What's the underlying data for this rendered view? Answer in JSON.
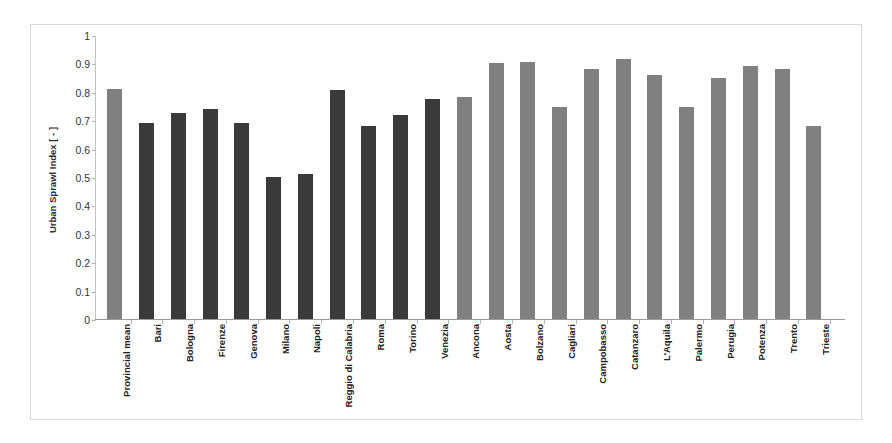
{
  "chart_data": {
    "type": "bar",
    "title": "",
    "subtitle": "",
    "xlabel": "",
    "ylabel": "Urban Sprawl Index [ - ]",
    "ylim": [
      0,
      1
    ],
    "yticks": [
      "0",
      "0.1",
      "0.2",
      "0.3",
      "0.4",
      "0.5",
      "0.6",
      "0.7",
      "0.8",
      "0.9",
      "1"
    ],
    "grid": false,
    "legend": "none",
    "colors": {
      "mean_and_provincial_capitals": "#808080",
      "metropolitan_cities": "#3a3a3a",
      "axis": "#9b9b9b",
      "frame": "#d9d9d9",
      "text": "#222222"
    },
    "categories": [
      "Provincial mean",
      "Bari",
      "Bologna",
      "Firenze",
      "Genova",
      "Milano",
      "Napoli",
      "Reggio di Calabria",
      "Roma",
      "Torino",
      "Venezia",
      "Ancona",
      "Aosta",
      "Bolzano",
      "Cagliari",
      "Campobasso",
      "Catanzaro",
      "L'Aquila",
      "Palermo",
      "Perugia",
      "Potenza",
      "Trento",
      "Trieste"
    ],
    "values": [
      0.81,
      0.69,
      0.725,
      0.74,
      0.69,
      0.5,
      0.51,
      0.805,
      0.68,
      0.72,
      0.775,
      0.78,
      0.9,
      0.905,
      0.745,
      0.88,
      0.915,
      0.86,
      0.745,
      0.85,
      0.89,
      0.88,
      0.68
    ],
    "bar_groups": [
      "mean",
      "dark",
      "dark",
      "dark",
      "dark",
      "dark",
      "dark",
      "dark",
      "dark",
      "dark",
      "dark",
      "gray",
      "gray",
      "gray",
      "gray",
      "gray",
      "gray",
      "gray",
      "gray",
      "gray",
      "gray",
      "gray",
      "gray"
    ]
  }
}
